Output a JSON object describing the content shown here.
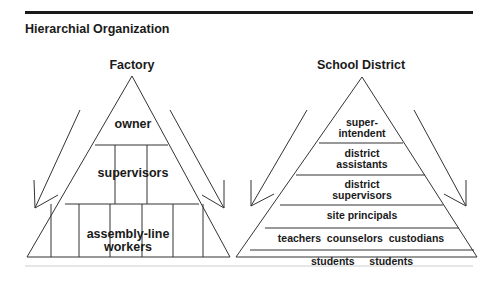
{
  "page": {
    "title": "Hierarchial Organization"
  },
  "factory": {
    "title": "Factory",
    "levels": [
      {
        "label": "owner"
      },
      {
        "label": "supervisors"
      },
      {
        "label": "assembly-line\nworkers",
        "line1": "assembly-line",
        "line2": "workers"
      }
    ]
  },
  "school_district": {
    "title": "School District",
    "levels": [
      {
        "line1": "super-",
        "line2": "intendent"
      },
      {
        "line1": "district",
        "line2": "assistants"
      },
      {
        "line1": "district",
        "line2": "supervisors"
      },
      {
        "label": "site principals"
      },
      {
        "label": "teachers  counselors  custodians"
      },
      {
        "label": "students     students"
      }
    ]
  },
  "colors": {
    "ink": "#1a1a1a",
    "line": "#333333",
    "rule_bottom": "#e6e6e6"
  }
}
